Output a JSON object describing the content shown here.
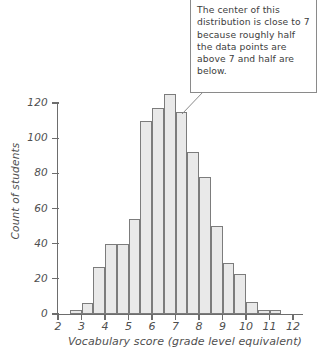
{
  "chart_data": {
    "type": "bar",
    "title": "",
    "xlabel": "Vocabulary score (grade level equivalent)",
    "ylabel": "Count of students",
    "xlim": [
      2,
      12
    ],
    "ylim": [
      0,
      128
    ],
    "grid": false,
    "legend": null,
    "bin_width": 0.5,
    "xticks": [
      "2",
      "3",
      "4",
      "5",
      "6",
      "7",
      "8",
      "9",
      "10",
      "11",
      "12"
    ],
    "yticks": [
      "0",
      "20",
      "40",
      "60",
      "80",
      "100",
      "120"
    ],
    "bins": [
      {
        "start": 2.0,
        "end": 2.5,
        "value": 0
      },
      {
        "start": 2.5,
        "end": 3.0,
        "value": 2
      },
      {
        "start": 3.0,
        "end": 3.5,
        "value": 6
      },
      {
        "start": 3.5,
        "end": 4.0,
        "value": 27
      },
      {
        "start": 4.0,
        "end": 4.5,
        "value": 40
      },
      {
        "start": 4.5,
        "end": 5.0,
        "value": 40
      },
      {
        "start": 5.0,
        "end": 5.5,
        "value": 54
      },
      {
        "start": 5.5,
        "end": 6.0,
        "value": 110
      },
      {
        "start": 6.0,
        "end": 6.5,
        "value": 117
      },
      {
        "start": 6.5,
        "end": 7.0,
        "value": 125
      },
      {
        "start": 7.0,
        "end": 7.5,
        "value": 115
      },
      {
        "start": 7.5,
        "end": 8.0,
        "value": 92
      },
      {
        "start": 8.0,
        "end": 8.5,
        "value": 78
      },
      {
        "start": 8.5,
        "end": 9.0,
        "value": 50
      },
      {
        "start": 9.0,
        "end": 9.5,
        "value": 29
      },
      {
        "start": 9.5,
        "end": 10.0,
        "value": 23
      },
      {
        "start": 10.0,
        "end": 10.5,
        "value": 7
      },
      {
        "start": 10.5,
        "end": 11.0,
        "value": 2
      },
      {
        "start": 11.0,
        "end": 11.5,
        "value": 2
      },
      {
        "start": 11.5,
        "end": 12.0,
        "value": 0
      }
    ],
    "annotations": [
      {
        "id": "center-callout",
        "text": "The center of this distribution is close to 7 because roughly half the data points are above 7 and half are below.",
        "points_to_x": 7.0
      }
    ],
    "colors": {
      "bar_fill": "#e9e9e9",
      "bar_stroke": "#7c7c7c",
      "axis": "#6d6d6d",
      "text": "#4f4f4f",
      "callout_border": "#8a8a8a",
      "background": "#ffffff"
    }
  }
}
